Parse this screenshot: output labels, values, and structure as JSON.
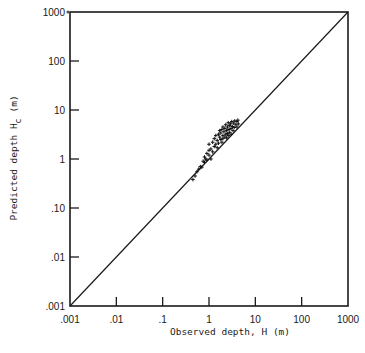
{
  "chart_data": {
    "type": "scatter",
    "title": "",
    "xlabel": "Observed depth, H (m)",
    "ylabel": "Predicted depth H_c (m)",
    "ylabel_main": "Predicted depth H",
    "ylabel_sub": "c",
    "ylabel_unit": "(m)",
    "xscale": "log",
    "yscale": "log",
    "xlim": [
      0.001,
      1000
    ],
    "ylim": [
      0.001,
      1000
    ],
    "x_ticks": [
      ".001",
      ".01",
      ".1",
      "1",
      "10",
      "100",
      "1000"
    ],
    "y_ticks": [
      ".001",
      ".01",
      ".10",
      "1",
      "10",
      "100",
      "1000"
    ],
    "grid": false,
    "legend": null,
    "reference_line": {
      "label": "1:1 line",
      "from": [
        0.001,
        0.001
      ],
      "to": [
        1000,
        1000
      ]
    },
    "series": [
      {
        "name": "observations",
        "marker": "+",
        "points": [
          [
            0.45,
            0.38
          ],
          [
            0.5,
            0.45
          ],
          [
            0.55,
            0.55
          ],
          [
            0.6,
            0.62
          ],
          [
            0.65,
            0.7
          ],
          [
            0.7,
            0.68
          ],
          [
            0.75,
            0.9
          ],
          [
            0.8,
            0.85
          ],
          [
            0.8,
            1.1
          ],
          [
            0.85,
            1.0
          ],
          [
            0.9,
            1.3
          ],
          [
            0.9,
            0.95
          ],
          [
            1.0,
            1.5
          ],
          [
            1.0,
            1.2
          ],
          [
            1.0,
            2.0
          ],
          [
            1.1,
            1.6
          ],
          [
            1.1,
            1.0
          ],
          [
            1.2,
            2.2
          ],
          [
            1.2,
            1.4
          ],
          [
            1.3,
            1.8
          ],
          [
            1.3,
            2.6
          ],
          [
            1.4,
            2.0
          ],
          [
            1.4,
            3.0
          ],
          [
            1.5,
            2.4
          ],
          [
            1.5,
            1.7
          ],
          [
            1.6,
            3.2
          ],
          [
            1.6,
            2.1
          ],
          [
            1.7,
            2.8
          ],
          [
            1.7,
            3.8
          ],
          [
            1.8,
            2.5
          ],
          [
            1.8,
            3.4
          ],
          [
            1.9,
            4.0
          ],
          [
            1.9,
            2.2
          ],
          [
            2.0,
            3.0
          ],
          [
            2.0,
            4.5
          ],
          [
            2.0,
            2.6
          ],
          [
            2.1,
            3.6
          ],
          [
            2.2,
            2.8
          ],
          [
            2.2,
            4.2
          ],
          [
            2.3,
            3.2
          ],
          [
            2.3,
            5.0
          ],
          [
            2.4,
            3.8
          ],
          [
            2.4,
            2.7
          ],
          [
            2.5,
            4.5
          ],
          [
            2.5,
            3.3
          ],
          [
            2.6,
            5.5
          ],
          [
            2.6,
            3.0
          ],
          [
            2.7,
            4.0
          ],
          [
            2.8,
            4.8
          ],
          [
            2.8,
            3.5
          ],
          [
            2.9,
            5.2
          ],
          [
            3.0,
            4.2
          ],
          [
            3.0,
            3.2
          ],
          [
            3.1,
            5.8
          ],
          [
            3.2,
            4.6
          ],
          [
            3.3,
            3.8
          ],
          [
            3.4,
            5.4
          ],
          [
            3.5,
            4.4
          ],
          [
            3.6,
            6.0
          ],
          [
            3.8,
            5.0
          ],
          [
            4.0,
            4.5
          ],
          [
            4.0,
            5.8
          ],
          [
            4.2,
            6.2
          ],
          [
            4.3,
            5.2
          ]
        ]
      }
    ]
  },
  "axes": {
    "x_ticks": [
      ".001",
      ".01",
      ".1",
      "1",
      "10",
      "100",
      "1000"
    ],
    "y_ticks": [
      ".001",
      ".01",
      ".10",
      "1",
      "10",
      "100",
      "1000"
    ],
    "xlabel": "Observed depth, H (m)",
    "ylabel_main": "Predicted depth H",
    "ylabel_sub": "c",
    "ylabel_unit": "(m)"
  }
}
